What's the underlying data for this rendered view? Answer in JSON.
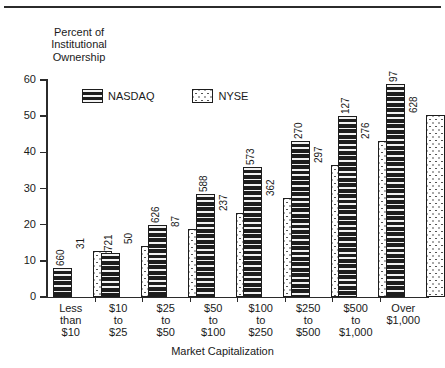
{
  "chart_data": {
    "type": "bar",
    "title": "",
    "ylabel": "Percent of\nInstitutional\nOwnership",
    "xlabel": "Market Capitalization",
    "ylim": [
      0,
      60
    ],
    "yticks": [
      0,
      10,
      20,
      30,
      40,
      50,
      60
    ],
    "ytick_labels": [
      "0",
      "10",
      "20",
      "30",
      "40",
      "50",
      "60"
    ],
    "grid": false,
    "legend_position": "upper-left-inside",
    "categories": [
      "Less\nthan\n$10",
      "$10\nto\n$25",
      "$25\nto\n$50",
      "$50\nto\n$100",
      "$100\nto\n$250",
      "$250\nto\n$500",
      "$500\nto\n$1,000",
      "Over\n$1,000"
    ],
    "series": [
      {
        "name": "NASDAQ",
        "values": [
          8,
          12.3,
          20,
          28.5,
          36,
          43,
          50,
          59
        ],
        "point_labels": [
          "660",
          "721",
          "626",
          "588",
          "573",
          "270",
          "127",
          "97"
        ]
      },
      {
        "name": "NYSE",
        "values": [
          12.7,
          14.2,
          18.8,
          23.3,
          27.5,
          36.5,
          43,
          50.3
        ],
        "point_labels": [
          "31",
          "50",
          "87",
          "237",
          "362",
          "297",
          "276",
          "628"
        ]
      }
    ],
    "point_label_note": "Numbers above each bar are sample counts (number of firms)"
  },
  "legend": {
    "entries": [
      {
        "label": "NASDAQ",
        "swatch": "dark-horizontal-stripes"
      },
      {
        "label": "NYSE",
        "swatch": "white-dotted"
      }
    ]
  },
  "colors": {
    "nasdaq_fill": "#1d1d1d",
    "nyse_fill": "#ffffff",
    "axis": "#2b2b2b",
    "text": "#1a1a1a",
    "background": "#ffffff"
  }
}
